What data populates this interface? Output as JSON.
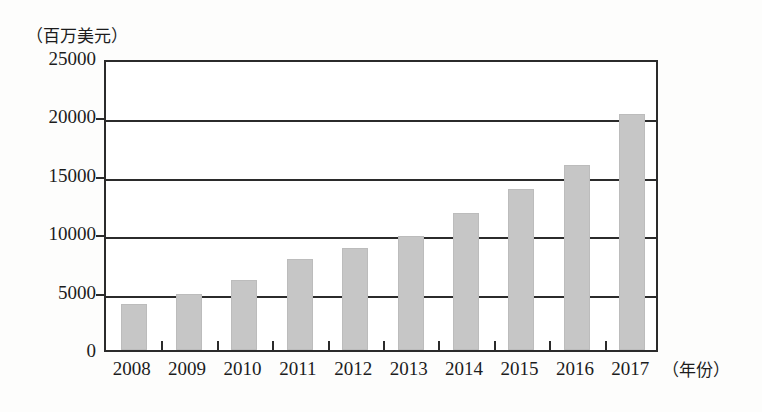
{
  "chart_data": {
    "type": "bar",
    "title": "",
    "subtitle": "",
    "xlabel": "（年份）",
    "ylabel": "（百万美元）",
    "categories": [
      "2008",
      "2009",
      "2010",
      "2011",
      "2012",
      "2013",
      "2014",
      "2015",
      "2016",
      "2017"
    ],
    "values": [
      3900,
      4800,
      6000,
      7800,
      8700,
      9800,
      11700,
      13800,
      15800,
      20200
    ],
    "ylim": [
      0,
      25000
    ],
    "yticks": [
      "0",
      "5000",
      "10000",
      "15000",
      "20000",
      "25000"
    ],
    "ytick_values": [
      0,
      5000,
      10000,
      15000,
      20000,
      25000
    ],
    "grid": true,
    "legend": "none",
    "bar_color": "#c6c6c6",
    "axis_color": "#2b2b2b",
    "background_color": "#ffffff"
  },
  "axes": {
    "y_unit_caption": "（百万美元）",
    "x_unit_caption": "（年份）"
  }
}
